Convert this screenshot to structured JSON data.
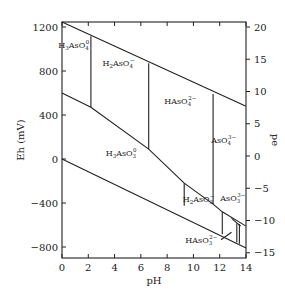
{
  "diagram": {
    "type": "Eh-pH (Pourbaix) diagram",
    "system": "Arsenic",
    "x_axis": {
      "label": "pH",
      "range": [
        0,
        14
      ],
      "ticks": [
        "0",
        "2",
        "4",
        "6",
        "8",
        "10",
        "12",
        "14"
      ]
    },
    "y_axis_left": {
      "label": "Eh (mV)",
      "range": [
        -880,
        1250
      ],
      "ticks": [
        "1200",
        "800",
        "400",
        "0",
        "-400",
        "-800"
      ],
      "tick_values": [
        1200,
        800,
        400,
        0,
        -400,
        -800
      ]
    },
    "y_axis_right": {
      "label": "pe",
      "ticks": [
        "20",
        "15",
        "10",
        "5",
        "0",
        "-5",
        "-10",
        "-15"
      ],
      "tick_values": [
        20,
        15,
        10,
        5,
        0,
        -5,
        -10,
        -15
      ]
    },
    "species": [
      {
        "id": "h3aso4",
        "base": "H",
        "sub1": "3",
        "mid": "AsO",
        "sub2": "4",
        "sup": "0",
        "ph": 0.9,
        "eh": 1010
      },
      {
        "id": "h2aso4",
        "base": "H",
        "sub1": "2",
        "mid": "AsO",
        "sub2": "4",
        "sup": "−",
        "ph": 4.3,
        "eh": 850
      },
      {
        "id": "haso4",
        "base": "H",
        "sub1": "",
        "mid": "AsO",
        "sub2": "4",
        "sup": "2−",
        "ph": 9.0,
        "eh": 500
      },
      {
        "id": "aso4",
        "base": "",
        "sub1": "",
        "mid": "AsO",
        "sub2": "4",
        "sup": "3−",
        "ph": 12.3,
        "eh": 150
      },
      {
        "id": "h3aso3",
        "base": "H",
        "sub1": "3",
        "mid": "AsO",
        "sub2": "3",
        "sup": "0",
        "ph": 4.5,
        "eh": 30
      },
      {
        "id": "h2aso3",
        "base": "H",
        "sub1": "2",
        "mid": "AsO",
        "sub2": "3",
        "sup": "−",
        "ph": 10.4,
        "eh": -395
      },
      {
        "id": "aso3",
        "base": "",
        "sub1": "",
        "mid": "AsO",
        "sub2": "3",
        "sup": "3−",
        "ph": 13.0,
        "eh": -380
      },
      {
        "id": "haso3",
        "base": "H",
        "sub1": "",
        "mid": "AsO",
        "sub2": "3",
        "sup": "2−",
        "ph": 10.6,
        "eh": -760
      }
    ],
    "boundaries": [
      {
        "name": "water-upper-limit",
        "points": [
          [
            0,
            1245
          ],
          [
            14,
            480
          ]
        ]
      },
      {
        "name": "water-lower-limit",
        "points": [
          [
            0,
            0
          ],
          [
            14,
            -810
          ]
        ]
      },
      {
        "name": "as5-as3-boundary",
        "points": [
          [
            0,
            600
          ],
          [
            2.2,
            470
          ],
          [
            6.6,
            90
          ],
          [
            9.3,
            -220
          ],
          [
            11.5,
            -410
          ],
          [
            12.2,
            -480
          ],
          [
            14,
            -610
          ]
        ]
      },
      {
        "name": "h3aso4-h2aso4",
        "points": [
          [
            2.2,
            1115
          ],
          [
            2.2,
            470
          ]
        ]
      },
      {
        "name": "h2aso4-haso4",
        "points": [
          [
            6.6,
            870
          ],
          [
            6.6,
            90
          ]
        ]
      },
      {
        "name": "haso4-aso4",
        "points": [
          [
            11.5,
            590
          ],
          [
            11.5,
            -410
          ]
        ]
      },
      {
        "name": "h3aso3-h2aso3",
        "points": [
          [
            9.3,
            -220
          ],
          [
            9.3,
            -425
          ]
        ]
      },
      {
        "name": "h2aso3-haso3",
        "points": [
          [
            12.2,
            -480
          ],
          [
            12.2,
            -685
          ]
        ]
      },
      {
        "name": "haso3-aso3-a",
        "points": [
          [
            13.3,
            -585
          ],
          [
            13.3,
            -760
          ]
        ]
      },
      {
        "name": "haso3-aso3-b",
        "points": [
          [
            13.5,
            -590
          ],
          [
            13.5,
            -770
          ]
        ]
      }
    ],
    "pointers": [
      {
        "name": "aso3-pointer",
        "points": [
          [
            12.9,
            -540
          ],
          [
            13.6,
            -610
          ]
        ]
      },
      {
        "name": "haso3-pointer",
        "points": [
          [
            12.1,
            -735
          ],
          [
            12.9,
            -665
          ]
        ]
      }
    ]
  }
}
